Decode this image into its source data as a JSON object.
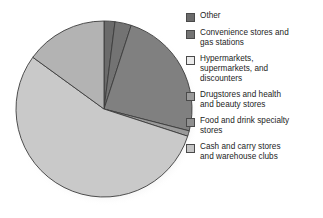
{
  "chart_data": {
    "type": "pie",
    "title": "",
    "subtitle": "",
    "xlabel": "",
    "ylabel": "",
    "grid": false,
    "legend_position": "right",
    "start_angle_deg": 0,
    "direction": "clockwise",
    "center": {
      "x": 104,
      "y": 109
    },
    "radius": 88,
    "categories": [
      "Other",
      "Convenience stores and gas stations",
      "Hypermarkets, supermarkets, and discounters",
      "Drugstores and health and beauty stores",
      "Food and drink specialty stores",
      "Cash and carry stores and warehouse clubs"
    ],
    "values": [
      2,
      3,
      24,
      1,
      55,
      15
    ],
    "slice_colors": [
      "#6b6b6b",
      "#737373",
      "#808080",
      "#9a9a9a",
      "#c9c9c9",
      "#b3b3b3"
    ],
    "annotations": []
  },
  "legend": {
    "items": [
      {
        "label": "Other",
        "color": "#6b6b6b",
        "swatch_name": "legend-swatch-other"
      },
      {
        "label": "Convenience stores and\ngas stations",
        "color": "#737373",
        "swatch_name": "legend-swatch-convenience-stores-and-gas-stations"
      },
      {
        "label": "Hypermarkets,\nsupermarkets, and\ndiscounters",
        "color": "#ebebeb",
        "swatch_name": "legend-swatch-hypermarkets-supermarkets-and-discounters"
      },
      {
        "label": "Drugstores and health\nand beauty stores",
        "color": "#9a9a9a",
        "swatch_name": "legend-swatch-drugstores-and-health-and-beauty-stores"
      },
      {
        "label": "Food and drink specialty\nstores",
        "color": "#8f8f8f",
        "swatch_name": "legend-swatch-food-and-drink-specialty-stores"
      },
      {
        "label": "Cash and carry stores\nand warehouse clubs",
        "color": "#c4c4c4",
        "swatch_name": "legend-swatch-cash-and-carry-stores-and-warehouse-clubs"
      }
    ]
  },
  "colors": {
    "background": "#ffffff",
    "slice_outline": "#3d3d3d",
    "text": "#1d1d1d",
    "slice_dark": "#808080",
    "slice_light": "#c9c9c9",
    "slice_mid": "#9a9a9a"
  }
}
